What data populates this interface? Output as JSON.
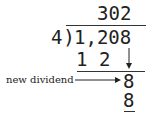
{
  "diagram": {
    "type": "long-division",
    "quotient": "302",
    "divisor": "4",
    "division_bracket": ")",
    "dividend": "1,208",
    "first_product": "1 2",
    "annotation_label": "new dividend",
    "new_dividend": "8",
    "second_product": "8"
  }
}
